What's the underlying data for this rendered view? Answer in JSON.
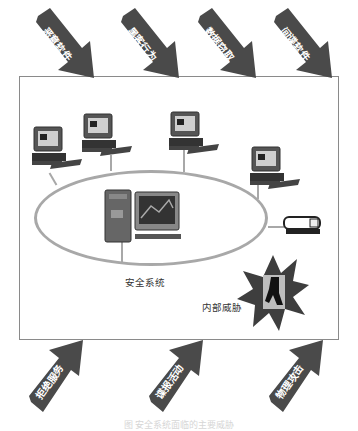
{
  "diagram": {
    "top_threats": [
      {
        "label": "恶意软件"
      },
      {
        "label": "黑客行为"
      },
      {
        "label": "数据窃取"
      },
      {
        "label": "间谍软件"
      }
    ],
    "bottom_threats": [
      {
        "label": "拒绝服务"
      },
      {
        "label": "谍报活动"
      },
      {
        "label": "物理攻击"
      }
    ],
    "center_label": "安全系统",
    "internal_threat_label": "内部威胁",
    "caption": "图  安全系统面临的主要威胁",
    "colors": {
      "arrow": "#4a4a4a",
      "frame": "#8a8a8a",
      "network_ring": "#a8a8a8",
      "starburst": "#3e3e3e"
    }
  }
}
